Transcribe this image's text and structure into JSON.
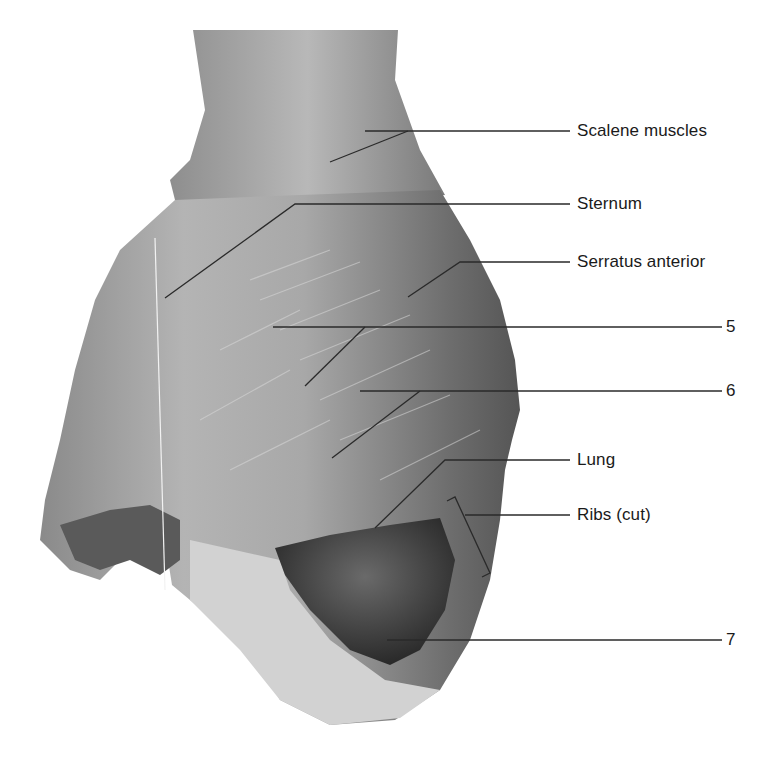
{
  "figure": {
    "labels": [
      {
        "id": "scalene",
        "text": "Scalene muscles",
        "x": 577,
        "y": 121
      },
      {
        "id": "sternum",
        "text": "Sternum",
        "x": 577,
        "y": 194
      },
      {
        "id": "serratus",
        "text": "Serratus anterior",
        "x": 577,
        "y": 252
      },
      {
        "id": "rib5",
        "text": "5",
        "x": 726,
        "y": 317
      },
      {
        "id": "rib6",
        "text": "6",
        "x": 726,
        "y": 381
      },
      {
        "id": "lung",
        "text": "Lung",
        "x": 577,
        "y": 450
      },
      {
        "id": "ribs-cut",
        "text": "Ribs (cut)",
        "x": 577,
        "y": 505
      },
      {
        "id": "rib7",
        "text": "7",
        "x": 726,
        "y": 623
      }
    ]
  }
}
